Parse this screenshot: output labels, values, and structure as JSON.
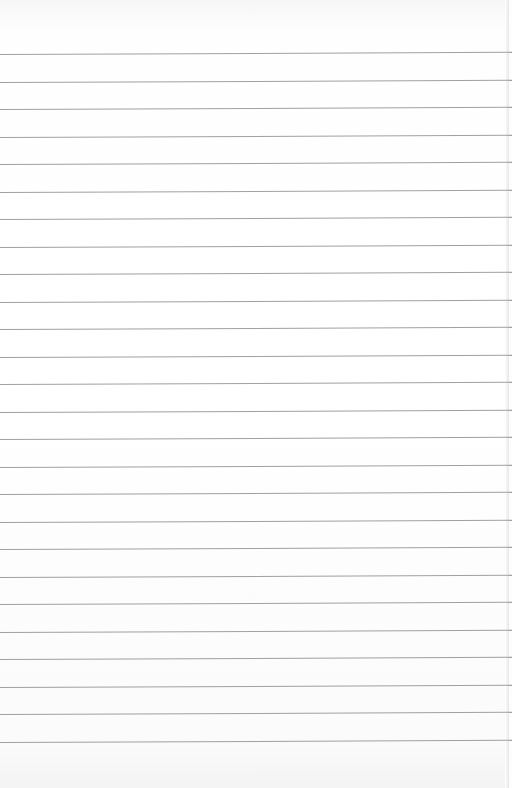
{
  "image": {
    "subject": "Blank lined notebook paper",
    "background_color": "#fdfdfd",
    "rule_color": "#8f8f8f",
    "rule_count": 26,
    "first_rule_y": 54,
    "rule_spacing": 27.5
  }
}
